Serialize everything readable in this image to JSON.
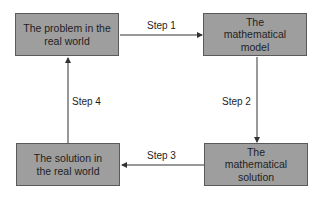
{
  "diagram": {
    "nodes": [
      {
        "id": "real-problem",
        "label": "The problem in the real world"
      },
      {
        "id": "math-model",
        "label": "The mathematical model"
      },
      {
        "id": "math-solution",
        "label": "The mathematical solution"
      },
      {
        "id": "real-solution",
        "label": "The solution in the real world"
      }
    ],
    "edges": [
      {
        "from": "real-problem",
        "to": "math-model",
        "label": "Step 1"
      },
      {
        "from": "math-model",
        "to": "math-solution",
        "label": "Step 2"
      },
      {
        "from": "math-solution",
        "to": "real-solution",
        "label": "Step 3"
      },
      {
        "from": "real-solution",
        "to": "real-problem",
        "label": "Step 4"
      }
    ],
    "colors": {
      "box_fill": "#9e9e9e",
      "box_border": "#5a5a5a",
      "line": "#333333"
    }
  }
}
